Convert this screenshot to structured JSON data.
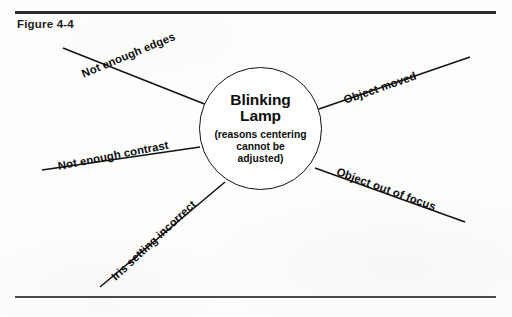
{
  "figure": {
    "caption": "Figure 4-4"
  },
  "diagram": {
    "type": "radial-cause-diagram",
    "center": {
      "title_line1": "Blinking",
      "title_line2": "Lamp",
      "subtitle_line1": "(reasons centering",
      "subtitle_line2": "cannot be",
      "subtitle_line3": "adjusted)"
    },
    "branches": [
      {
        "id": "not-enough-edges",
        "label": "Not enough edges",
        "position": "upper-left",
        "angle_deg": -22.5,
        "line": {
          "x1": 63,
          "y1": 48,
          "x2": 207,
          "y2": 105
        },
        "label_anchor": {
          "x": 82,
          "y": 68
        }
      },
      {
        "id": "not-enough-contrast",
        "label": "Not enough contrast",
        "position": "lower-left",
        "angle_deg": -11,
        "line": {
          "x1": 42,
          "y1": 170,
          "x2": 200,
          "y2": 147
        },
        "label_anchor": {
          "x": 58,
          "y": 160
        }
      },
      {
        "id": "iris-setting-incorrect",
        "label": "Iris setting incorrect",
        "position": "bottom-left",
        "angle_deg": -43,
        "line": {
          "x1": 100,
          "y1": 287,
          "x2": 225,
          "y2": 182
        },
        "label_anchor": {
          "x": 113,
          "y": 272
        }
      },
      {
        "id": "object-moved",
        "label": "Object moved",
        "position": "upper-right",
        "angle_deg": -19,
        "line": {
          "x1": 316,
          "y1": 110,
          "x2": 470,
          "y2": 57
        },
        "label_anchor": {
          "x": 344,
          "y": 94
        }
      },
      {
        "id": "object-out-of-focus",
        "label": "Object out of focus",
        "position": "lower-right",
        "angle_deg": 20,
        "line": {
          "x1": 315,
          "y1": 168,
          "x2": 465,
          "y2": 222
        },
        "label_anchor": {
          "x": 337,
          "y": 165
        }
      }
    ],
    "colors": {
      "ink": "#111111",
      "rule": "#2c2c2c",
      "paper": "#fdfdfc"
    }
  }
}
